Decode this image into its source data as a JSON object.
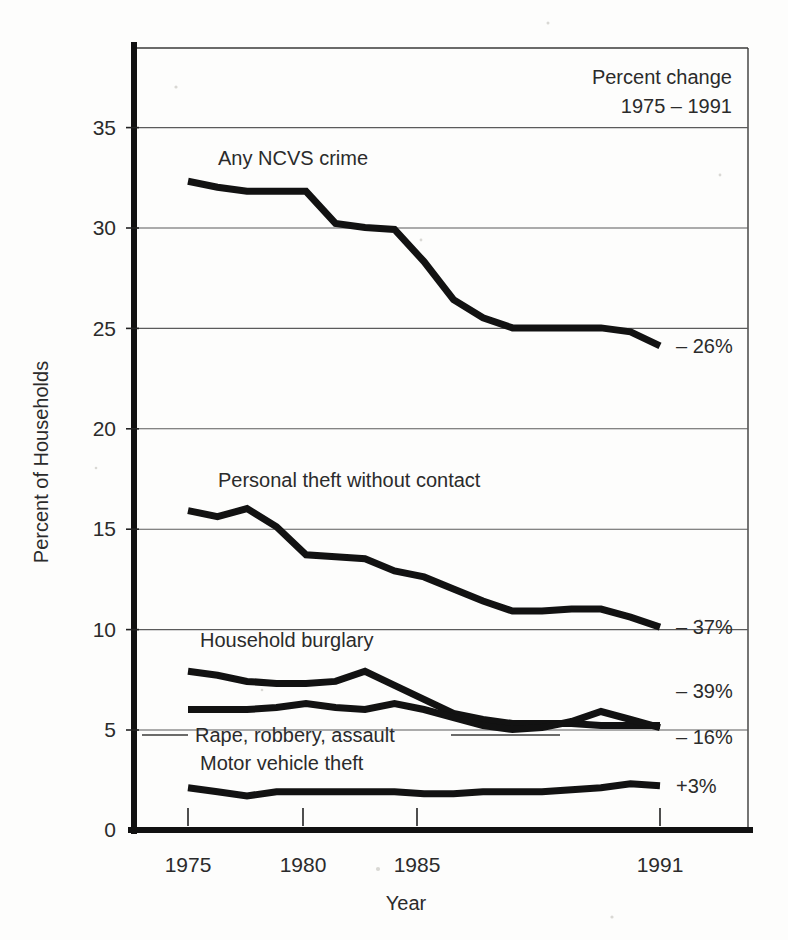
{
  "figure": {
    "corner_note_line1": "Percent change",
    "corner_note_line2": "1975 – 1991",
    "y_axis_title": "Percent of Households",
    "x_axis_title": "Year"
  },
  "axes": {
    "y_ticks": [
      "0",
      "5",
      "10",
      "15",
      "20",
      "25",
      "30",
      "35"
    ],
    "x_ticks": [
      "1975",
      "1980",
      "1985",
      "1991"
    ]
  },
  "series_labels": {
    "ncvs": "Any NCVS crime",
    "personal_theft": "Personal theft without contact",
    "burglary": "Household burglary",
    "violent": "Rape, robbery, assault",
    "mvt": "Motor vehicle theft"
  },
  "change_labels": {
    "ncvs": "– 26%",
    "personal_theft": "– 37%",
    "burglary": "– 39%",
    "violent": "– 16%",
    "mvt": "+3%"
  },
  "chart_data": {
    "type": "line",
    "title": "",
    "subtitle": "",
    "xlabel": "Year",
    "ylabel": "Percent of Households",
    "xlim": [
      1975,
      1991
    ],
    "ylim": [
      0,
      38.5
    ],
    "yticks": [
      0,
      5,
      10,
      15,
      20,
      25,
      30,
      35
    ],
    "xticks": [
      1975,
      1980,
      1985,
      1991
    ],
    "grid": "horizontal",
    "legend": "inline-labels",
    "annotations": [
      {
        "text": "Percent change",
        "position": "top-right-inside"
      },
      {
        "text": "1975 – 1991",
        "position": "top-right-inside"
      }
    ],
    "x": [
      1975,
      1976,
      1977,
      1978,
      1979,
      1980,
      1981,
      1982,
      1983,
      1984,
      1985,
      1986,
      1987,
      1988,
      1989,
      1990,
      1991
    ],
    "series": [
      {
        "name": "Any NCVS crime",
        "change_1975_1991": "– 26%",
        "values": [
          32.3,
          32.0,
          31.8,
          31.8,
          31.8,
          30.2,
          30.0,
          29.9,
          28.3,
          26.4,
          25.5,
          25.0,
          25.0,
          25.0,
          25.0,
          24.8,
          24.1
        ]
      },
      {
        "name": "Personal theft without contact",
        "change_1975_1991": "– 37%",
        "values": [
          15.9,
          15.6,
          16.0,
          15.1,
          13.7,
          13.6,
          13.5,
          12.9,
          12.6,
          12.0,
          11.4,
          10.9,
          10.9,
          11.0,
          11.0,
          10.6,
          10.1
        ]
      },
      {
        "name": "Household burglary",
        "change_1975_1991": "– 39%",
        "values": [
          7.9,
          7.7,
          7.4,
          7.3,
          7.3,
          7.4,
          7.9,
          7.2,
          6.5,
          5.8,
          5.5,
          5.3,
          5.3,
          5.3,
          5.2,
          5.2,
          5.2
        ]
      },
      {
        "name": "Rape, robbery, assault",
        "change_1975_1991": "– 16%",
        "values": [
          6.0,
          6.0,
          6.0,
          6.1,
          6.3,
          6.1,
          6.0,
          6.3,
          6.0,
          5.6,
          5.2,
          5.0,
          5.1,
          5.4,
          5.9,
          5.5,
          5.1
        ]
      },
      {
        "name": "Motor vehicle theft",
        "change_1975_1991": "+3%",
        "values": [
          2.1,
          1.9,
          1.7,
          1.9,
          1.9,
          1.9,
          1.9,
          1.9,
          1.8,
          1.8,
          1.9,
          1.9,
          1.9,
          2.0,
          2.1,
          2.3,
          2.2
        ]
      }
    ]
  }
}
